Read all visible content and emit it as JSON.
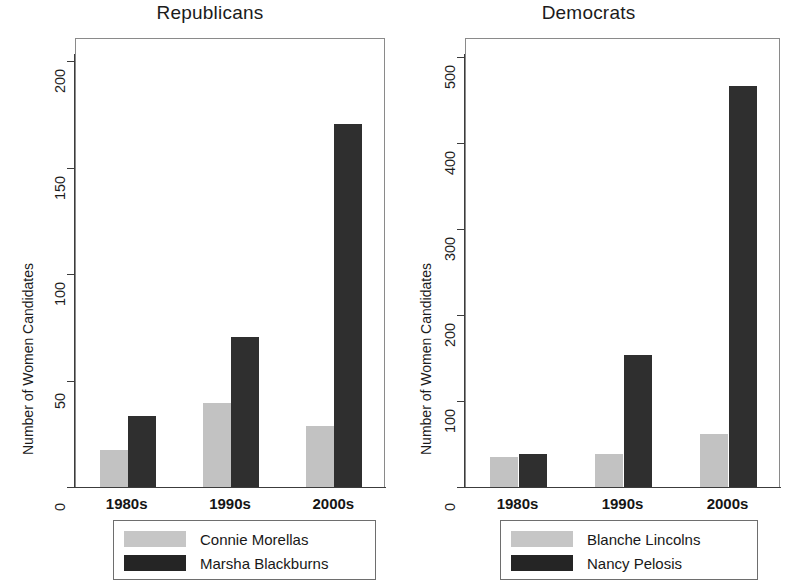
{
  "figure": {
    "background": "#ffffff",
    "light_color": "#c2c2c2",
    "dark_color": "#2f2f2f"
  },
  "panels": [
    {
      "title": "Republicans",
      "ylabel": "Number of Women Candidates",
      "yticks": [
        "0",
        "50",
        "100",
        "150",
        "200"
      ],
      "xticks": [
        "1980s",
        "1990s",
        "2000s"
      ],
      "legend": [
        {
          "label": "Connie Morellas",
          "swatch": "light"
        },
        {
          "label": "Marsha Blackburns",
          "swatch": "dark"
        }
      ]
    },
    {
      "title": "Democrats",
      "ylabel": "Number of Women Candidates",
      "yticks": [
        "0",
        "100",
        "200",
        "300",
        "400",
        "500"
      ],
      "xticks": [
        "1980s",
        "1990s",
        "2000s"
      ],
      "legend": [
        {
          "label": "Blanche Lincolns",
          "swatch": "light"
        },
        {
          "label": "Nancy Pelosis",
          "swatch": "dark"
        }
      ]
    }
  ],
  "chart_data": [
    {
      "type": "bar",
      "title": "Republicans",
      "xlabel": "",
      "ylabel": "Number of Women Candidates",
      "categories": [
        "1980s",
        "1990s",
        "2000s"
      ],
      "series": [
        {
          "name": "Connie Morellas",
          "color": "#c2c2c2",
          "values": [
            18,
            40,
            29
          ]
        },
        {
          "name": "Marsha Blackburns",
          "color": "#2f2f2f",
          "values": [
            34,
            71,
            171
          ]
        }
      ],
      "ylim": [
        0,
        210
      ],
      "yticks": [
        0,
        50,
        100,
        150,
        200
      ],
      "grid": false,
      "legend_position": "below"
    },
    {
      "type": "bar",
      "title": "Democrats",
      "xlabel": "",
      "ylabel": "Number of Women Candidates",
      "categories": [
        "1980s",
        "1990s",
        "2000s"
      ],
      "series": [
        {
          "name": "Blanche Lincolns",
          "color": "#c2c2c2",
          "values": [
            36,
            40,
            63
          ]
        },
        {
          "name": "Nancy Pelosis",
          "color": "#2f2f2f",
          "values": [
            40,
            155,
            468
          ]
        }
      ],
      "ylim": [
        0,
        520
      ],
      "yticks": [
        0,
        100,
        200,
        300,
        400,
        500
      ],
      "grid": false,
      "legend_position": "below"
    }
  ]
}
